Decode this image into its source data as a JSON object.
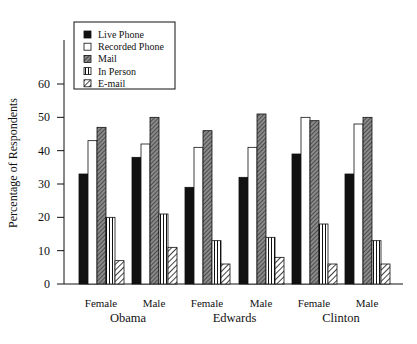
{
  "chart_data": {
    "type": "bar",
    "title": "",
    "xlabel": "",
    "ylabel": "Percentage of Respondents",
    "ylim": [
      0,
      60
    ],
    "yticks": [
      0,
      10,
      20,
      30,
      40,
      50,
      60
    ],
    "grid": false,
    "legend_position": "upper-left",
    "groups": [
      {
        "candidate": "Obama",
        "subgroups": [
          "Female",
          "Male"
        ]
      },
      {
        "candidate": "Edwards",
        "subgroups": [
          "Female",
          "Male"
        ]
      },
      {
        "candidate": "Clinton",
        "subgroups": [
          "Female",
          "Male"
        ]
      }
    ],
    "categories": [
      "Obama Female",
      "Obama Male",
      "Edwards Female",
      "Edwards Male",
      "Clinton Female",
      "Clinton Male"
    ],
    "category_labels": [
      "Female",
      "Male",
      "Female",
      "Male",
      "Female",
      "Male"
    ],
    "candidate_labels": [
      "Obama",
      "Edwards",
      "Clinton"
    ],
    "series": [
      {
        "name": "Live Phone",
        "pattern": "solid-black",
        "values": [
          33,
          38,
          29,
          32,
          39,
          33
        ]
      },
      {
        "name": "Recorded Phone",
        "pattern": "white",
        "values": [
          43,
          42,
          41,
          41,
          50,
          48
        ]
      },
      {
        "name": "Mail",
        "pattern": "dense-crosshatch",
        "values": [
          47,
          50,
          46,
          51,
          49,
          50
        ]
      },
      {
        "name": "In Person",
        "pattern": "vertical-lines",
        "values": [
          20,
          21,
          13,
          14,
          18,
          13
        ]
      },
      {
        "name": "E-mail",
        "pattern": "diagonal-lines",
        "values": [
          7,
          11,
          6,
          8,
          6,
          6
        ]
      }
    ]
  },
  "colors": {
    "ink": "#111111",
    "background": "#ffffff",
    "mail_fill": "#6e6e6e"
  }
}
